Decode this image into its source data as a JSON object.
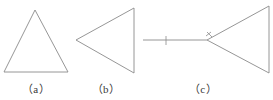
{
  "figure": {
    "background_color": "#ffffff",
    "stroke_color": "#8a8a8a",
    "label_color": "#3a3a3a",
    "stroke_width": 0.9,
    "panels": [
      {
        "id": "a",
        "label": "（a）",
        "shape": "triangle-up",
        "description": "upward pointing triangle",
        "points": "35,10 68,72 4,72",
        "tick_marks": []
      },
      {
        "id": "b",
        "label": "（b）",
        "shape": "triangle-left",
        "description": "left pointing triangle with vertical right edge",
        "points": "76,40 134,8 134,73",
        "tick_marks": []
      },
      {
        "id": "c",
        "label": "（c）",
        "shape": "triangle-left-with-segment",
        "description": "left pointing triangle with vertical right edge and a horizontal segment attached at the left vertex, both marked with congruence tick marks",
        "points": "207,40 269,6 269,73",
        "segment": {
          "x1": 143,
          "y1": 40,
          "x2": 207,
          "y2": 40
        },
        "tick_marks": [
          {
            "name": "segment-tick",
            "x": 166,
            "y": 40
          },
          {
            "name": "vertex-tick-upper",
            "x": 207,
            "y": 40
          },
          {
            "name": "vertex-tick-lower",
            "x": 207,
            "y": 40
          }
        ]
      }
    ]
  }
}
